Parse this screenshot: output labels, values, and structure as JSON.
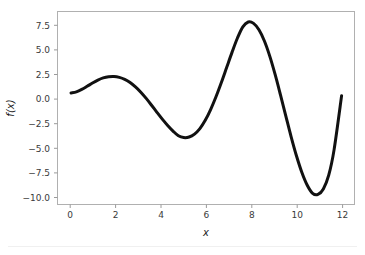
{
  "chart_data": {
    "type": "line",
    "title": "",
    "xlabel": "x",
    "ylabel": "f(x)",
    "xlim": [
      -0.63,
      13.2
    ],
    "ylim": [
      -12.2,
      8.9
    ],
    "grid": false,
    "legend": null,
    "line_color": "#111111",
    "line_width": 3,
    "xticks": [
      0,
      2,
      4,
      6,
      8,
      10,
      12
    ],
    "xticklabels": [
      "0",
      "2",
      "4",
      "6",
      "8",
      "10",
      "12"
    ],
    "yticks": [
      7.5,
      5.0,
      2.5,
      0.0,
      -2.5,
      -5.0,
      -7.5,
      -10.0
    ],
    "yticklabels": [
      "7.5",
      "5.0",
      "2.5",
      "0.0",
      "−2.5",
      "−5.0",
      "−7.5",
      "−10.0"
    ],
    "series": [
      {
        "name": "f(x)",
        "x": [
          0.0,
          0.25,
          0.5,
          0.75,
          1.0,
          1.25,
          1.5,
          1.75,
          2.0,
          2.25,
          2.5,
          2.75,
          3.0,
          3.25,
          3.5,
          3.75,
          4.0,
          4.25,
          4.5,
          4.75,
          5.0,
          5.25,
          5.5,
          5.75,
          6.0,
          6.25,
          6.5,
          6.75,
          7.0,
          7.25,
          7.5,
          7.75,
          8.0,
          8.25,
          8.5,
          8.75,
          9.0,
          9.25,
          9.5,
          9.75,
          10.0,
          10.25,
          10.5,
          10.75,
          11.0,
          11.25,
          11.5,
          11.75,
          12.0,
          12.25,
          12.6
        ],
        "y": [
          0.0,
          0.12,
          0.38,
          0.72,
          1.08,
          1.4,
          1.64,
          1.77,
          1.8,
          1.7,
          1.48,
          1.13,
          0.66,
          0.08,
          -0.6,
          -1.35,
          -2.12,
          -2.87,
          -3.56,
          -4.17,
          -4.68,
          -4.88,
          -4.82,
          -4.5,
          -3.9,
          -3.0,
          -1.82,
          -0.42,
          1.14,
          2.8,
          4.46,
          6.0,
          7.22,
          7.75,
          7.6,
          6.9,
          5.7,
          4.05,
          2.05,
          -0.18,
          -2.5,
          -4.8,
          -6.9,
          -8.7,
          -10.1,
          -10.98,
          -11.1,
          -10.5,
          -9.0,
          -6.2,
          -0.3
        ]
      }
    ],
    "extrema": [
      {
        "label": "local-maximum",
        "x": 2.0,
        "y": 1.8
      },
      {
        "label": "local-minimum",
        "x": 5.25,
        "y": -4.9
      },
      {
        "label": "global-maximum",
        "x": 8.15,
        "y": 7.8
      },
      {
        "label": "global-minimum",
        "x": 11.3,
        "y": -11.1
      }
    ]
  },
  "axes": {
    "x_axis_label": "x",
    "y_axis_label": "f(x)"
  }
}
